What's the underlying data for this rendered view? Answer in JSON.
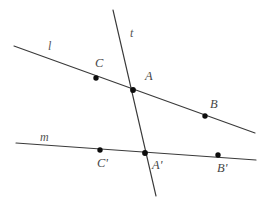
{
  "figure": {
    "width": 267,
    "height": 203,
    "background_color": "#ffffff",
    "line_color": "#3a3a3a",
    "point_color": "#0d0d0d",
    "label_color": "#4a4a4a"
  },
  "lines": [
    {
      "id": "line-l",
      "label": "l",
      "label_x": 48,
      "label_y": 40,
      "x1": 14,
      "y1": 46,
      "x2": 255,
      "y2": 133
    },
    {
      "id": "line-m",
      "label": "m",
      "label_x": 40,
      "label_y": 131,
      "x1": 16,
      "y1": 143,
      "x2": 256,
      "y2": 160
    },
    {
      "id": "line-t",
      "label": "t",
      "label_x": 130,
      "label_y": 27,
      "x1": 113,
      "y1": 10,
      "x2": 156,
      "y2": 196
    }
  ],
  "points": [
    {
      "id": "point-C",
      "label": "C",
      "cx": 96,
      "cy": 78,
      "label_x": 95,
      "label_y": 57,
      "on": "line-l"
    },
    {
      "id": "point-A",
      "label": "A",
      "cx": 133,
      "cy": 90,
      "label_x": 145,
      "label_y": 70,
      "on": "line-l,line-t"
    },
    {
      "id": "point-B",
      "label": "B",
      "cx": 205,
      "cy": 116,
      "label_x": 210,
      "label_y": 98,
      "on": "line-l"
    },
    {
      "id": "point-Cprime",
      "label": "C'",
      "cx": 100,
      "cy": 150,
      "label_x": 97,
      "label_y": 157,
      "on": "line-m"
    },
    {
      "id": "point-Aprime",
      "label": "A'",
      "cx": 145,
      "cy": 153,
      "label_x": 152,
      "label_y": 159,
      "on": "line-m,line-t"
    },
    {
      "id": "point-Bprime",
      "label": "B'",
      "cx": 218,
      "cy": 155,
      "label_x": 217,
      "label_y": 162,
      "on": "line-m"
    }
  ]
}
